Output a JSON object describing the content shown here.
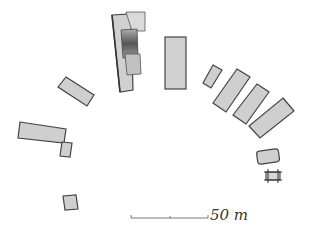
{
  "diagram": {
    "type": "archaeological-site-plan",
    "structures": [
      {
        "id": "large-complex",
        "desc": "layered tall building, north"
      },
      {
        "id": "tall-block-north",
        "desc": "tall rectangle right of complex"
      },
      {
        "id": "east-1",
        "desc": "small angled block"
      },
      {
        "id": "east-2",
        "desc": "long angled block"
      },
      {
        "id": "east-3",
        "desc": "long angled block"
      },
      {
        "id": "east-4",
        "desc": "long angled block"
      },
      {
        "id": "east-small",
        "desc": "rounded small block"
      },
      {
        "id": "east-gate",
        "desc": "small frame/gate"
      },
      {
        "id": "west-1",
        "desc": "angled block"
      },
      {
        "id": "west-2",
        "desc": "long horizontal block"
      },
      {
        "id": "west-3",
        "desc": "small block beside west-2"
      },
      {
        "id": "southwest",
        "desc": "small square block"
      }
    ],
    "scale_bar": {
      "label": "50 m",
      "value": 50,
      "unit": "m"
    }
  },
  "colors": {
    "fill": "#cfcfcf",
    "fill_dark": "#7a7a7a",
    "stroke": "#4a4a4a",
    "background": "#ffffff"
  }
}
